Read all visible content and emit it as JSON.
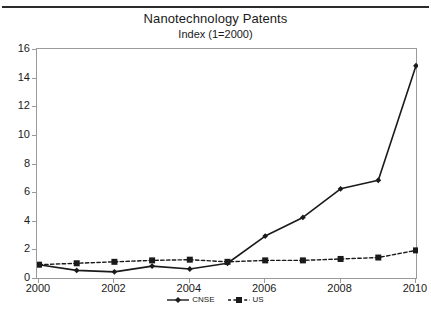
{
  "figure": {
    "caption_sliver": "",
    "title": "Nanotechnology Patents",
    "subtitle": "Index (1=2000)"
  },
  "colors": {
    "ink": "#1a1a1a",
    "frame": "#9a9a9a",
    "series_cnse": "#1a1a1a",
    "series_us": "#1a1a1a",
    "background": "#ffffff"
  },
  "axes": {
    "y_ticks": [
      "16",
      "14",
      "12",
      "10",
      "8",
      "6",
      "4",
      "2",
      "0"
    ],
    "x_ticks": [
      "2000",
      "2002",
      "2004",
      "2006",
      "2008",
      "2010"
    ]
  },
  "legend": {
    "items": [
      {
        "label": "CNSE",
        "marker": "diamond",
        "line": "solid"
      },
      {
        "label": "US",
        "marker": "square",
        "line": "dashed"
      }
    ]
  },
  "chart_data": {
    "type": "line",
    "title": "Nanotechnology Patents",
    "subtitle": "Index (1=2000)",
    "xlabel": "",
    "ylabel": "",
    "xlim": [
      2000,
      2010
    ],
    "ylim": [
      0,
      16
    ],
    "y_tick_values": [
      0,
      2,
      4,
      6,
      8,
      10,
      12,
      14,
      16
    ],
    "x_tick_values": [
      2000,
      2002,
      2004,
      2006,
      2008,
      2010
    ],
    "grid": false,
    "legend_position": "below-axis-center",
    "x": [
      2000,
      2001,
      2002,
      2003,
      2004,
      2005,
      2006,
      2007,
      2008,
      2009,
      2010
    ],
    "series": [
      {
        "name": "CNSE",
        "marker": "diamond",
        "line_style": "solid",
        "color": "#1a1a1a",
        "values": [
          1.0,
          0.6,
          0.5,
          0.9,
          0.7,
          1.1,
          3.0,
          4.3,
          6.3,
          6.9,
          14.9
        ]
      },
      {
        "name": "US",
        "marker": "square",
        "line_style": "dashed",
        "color": "#1a1a1a",
        "values": [
          1.0,
          1.1,
          1.2,
          1.3,
          1.35,
          1.2,
          1.3,
          1.3,
          1.4,
          1.5,
          2.0
        ]
      }
    ]
  }
}
